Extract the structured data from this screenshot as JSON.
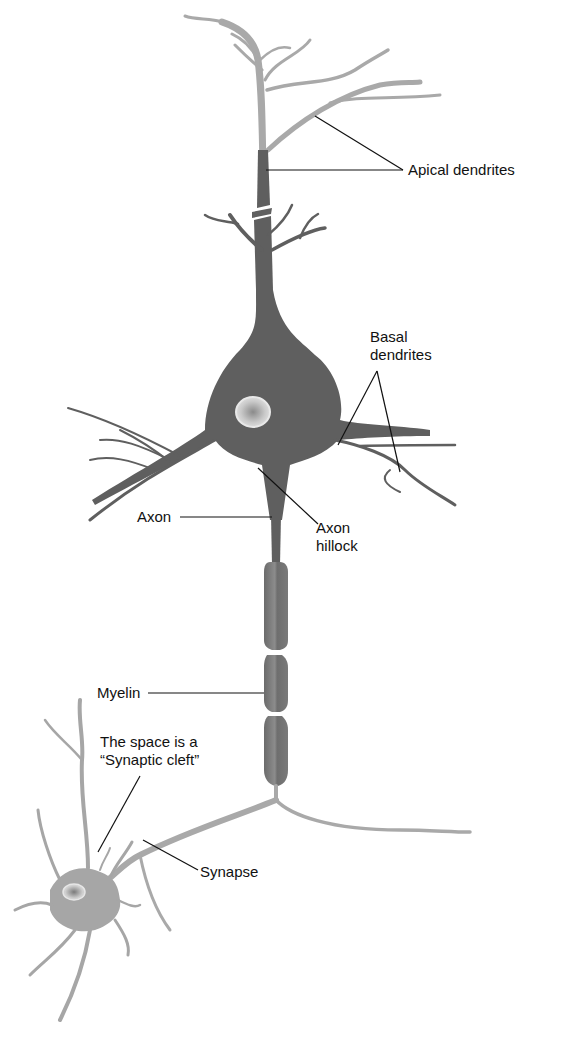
{
  "diagram": {
    "colors": {
      "main_neuron_dark": "#5f5f5f",
      "dendrite_light": "#a9a9a9",
      "second_neuron": "#a6a6a6",
      "leader_line": "#111111",
      "background": "#ffffff"
    },
    "labels": {
      "apical_dendrites": "Apical dendrites",
      "basal_dendrites_line1": "Basal",
      "basal_dendrites_line2": "dendrites",
      "axon": "Axon",
      "axon_hillock_line1": "Axon",
      "axon_hillock_line2": "hillock",
      "myelin": "Myelin",
      "synaptic_cleft_line1": "The space is a",
      "synaptic_cleft_line2": "“Synaptic cleft”",
      "synapse": "Synapse"
    }
  }
}
